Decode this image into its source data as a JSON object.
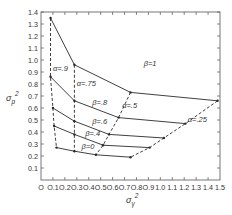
{
  "chart_data": {
    "type": "line",
    "title": "",
    "xlabel": "σγ²",
    "xlabel_base": "σ",
    "xlabel_sub": "γ",
    "xlabel_sup": "2",
    "ylabel": "σp²",
    "ylabel_base": "σ",
    "ylabel_sub": "p",
    "ylabel_sup": "2",
    "xlim": [
      0,
      1.5
    ],
    "ylim": [
      0,
      1.4
    ],
    "grid": false,
    "legend": "inline labels",
    "x_ticks": [
      "0",
      "0.1",
      "0.2",
      "0.3",
      "0.4",
      "0.5",
      "0.6",
      "0.7",
      "0.8",
      "0.9",
      "1.0",
      "1.1",
      "1.2",
      "1.3",
      "1.4",
      "1.5"
    ],
    "y_ticks": [
      "0.1",
      "0.2",
      "0.3",
      "0.4",
      "0.5",
      "0.6",
      "0.7",
      "0.8",
      "0.9",
      "1.0",
      "1.1",
      "1.2",
      "1.3",
      "1.4"
    ],
    "beta_series": [
      {
        "name": "β=1",
        "style": "solid",
        "points": [
          [
            0.08,
            1.35
          ],
          [
            0.28,
            0.96
          ],
          [
            0.75,
            0.73
          ],
          [
            1.48,
            0.66
          ]
        ]
      },
      {
        "name": "β=.8",
        "style": "solid",
        "points": [
          [
            0.08,
            0.86
          ],
          [
            0.28,
            0.66
          ],
          [
            0.65,
            0.52
          ],
          [
            1.21,
            0.47
          ]
        ]
      },
      {
        "name": "β=.6",
        "style": "solid",
        "points": [
          [
            0.1,
            0.6
          ],
          [
            0.28,
            0.49
          ],
          [
            0.57,
            0.38
          ],
          [
            1.03,
            0.35
          ]
        ]
      },
      {
        "name": "β=.4",
        "style": "solid",
        "points": [
          [
            0.11,
            0.45
          ],
          [
            0.28,
            0.38
          ],
          [
            0.52,
            0.29
          ],
          [
            0.91,
            0.27
          ]
        ]
      },
      {
        "name": "β=0",
        "style": "solid",
        "points": [
          [
            0.13,
            0.27
          ],
          [
            0.28,
            0.24
          ],
          [
            0.46,
            0.21
          ],
          [
            0.75,
            0.19
          ]
        ]
      }
    ],
    "alpha_series": [
      {
        "name": "α=.9",
        "style": "dashed",
        "points": [
          [
            0.08,
            1.35
          ],
          [
            0.08,
            0.86
          ],
          [
            0.1,
            0.6
          ],
          [
            0.11,
            0.45
          ],
          [
            0.13,
            0.27
          ]
        ]
      },
      {
        "name": "α=.75",
        "style": "dashed",
        "points": [
          [
            0.28,
            0.96
          ],
          [
            0.28,
            0.66
          ],
          [
            0.28,
            0.49
          ],
          [
            0.28,
            0.38
          ],
          [
            0.28,
            0.24
          ]
        ]
      },
      {
        "name": "α=.5",
        "style": "dashed",
        "points": [
          [
            0.75,
            0.73
          ],
          [
            0.65,
            0.52
          ],
          [
            0.57,
            0.38
          ],
          [
            0.52,
            0.29
          ],
          [
            0.46,
            0.21
          ]
        ]
      },
      {
        "name": "α=.25",
        "style": "dashed",
        "points": [
          [
            1.48,
            0.66
          ],
          [
            1.21,
            0.47
          ],
          [
            1.03,
            0.35
          ],
          [
            0.91,
            0.27
          ],
          [
            0.75,
            0.19
          ]
        ]
      }
    ],
    "annotations": [
      {
        "text": "β=1",
        "x": 0.86,
        "y": 0.95
      },
      {
        "text": "α=.9",
        "x": 0.1,
        "y": 0.905
      },
      {
        "text": "α=.75",
        "x": 0.3,
        "y": 0.78
      },
      {
        "text": "β=.8",
        "x": 0.43,
        "y": 0.625
      },
      {
        "text": "α=.5",
        "x": 0.68,
        "y": 0.6
      },
      {
        "text": "β=.6",
        "x": 0.43,
        "y": 0.465
      },
      {
        "text": "β=.4",
        "x": 0.37,
        "y": 0.365
      },
      {
        "text": "α=.25",
        "x": 1.23,
        "y": 0.48
      },
      {
        "text": "β=0",
        "x": 0.34,
        "y": 0.255
      }
    ]
  },
  "style": {
    "line_color": "#2a2a2a",
    "axis_color": "#555555",
    "text_color": "#333333"
  }
}
